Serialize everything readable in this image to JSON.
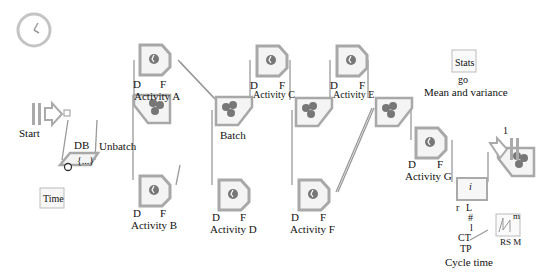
{
  "diagram": {
    "blocks": {
      "clock": {
        "label": ""
      },
      "start": {
        "label": "Start"
      },
      "db": {
        "label": "DB",
        "inner": "{...}"
      },
      "time": {
        "label": "Time"
      },
      "unbatch": {
        "label": "Unbatch"
      },
      "activity_a": {
        "label": "Activity A",
        "d": "D",
        "f": "F"
      },
      "activity_b": {
        "label": "Activity B",
        "d": "D",
        "f": "F"
      },
      "batch": {
        "label": "Batch"
      },
      "activity_c": {
        "label": "Activity C",
        "d": "D",
        "f": "F"
      },
      "activity_d": {
        "label": "Activity D",
        "d": "D",
        "f": "F"
      },
      "activity_e": {
        "label": "Activity E",
        "d": "D",
        "f": "F"
      },
      "activity_f": {
        "label": "Activity F",
        "d": "D",
        "f": "F"
      },
      "activity_g": {
        "label": "Activity G",
        "d": "D",
        "f": "F"
      },
      "stats": {
        "label": "Stats",
        "port": "go",
        "caption": "Mean and variance"
      },
      "exit": {
        "port": "1"
      },
      "cycle_time": {
        "inner": "i",
        "caption": "Cycle time",
        "ports": [
          "r",
          "L",
          "#",
          "l",
          "CT",
          "TP"
        ]
      },
      "plotter": {
        "m": "m",
        "v": "v",
        "rsm": "RS M"
      }
    }
  },
  "colors": {
    "block_fill": "#f4f4f4",
    "block_border": "#a8a8a8",
    "connector": "#9a9a9a",
    "item": "#777777"
  }
}
